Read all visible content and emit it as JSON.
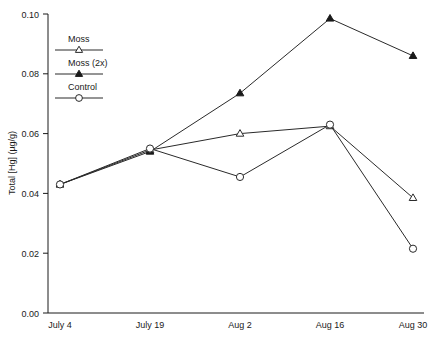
{
  "chart_data": {
    "type": "line",
    "title": "",
    "xlabel": "",
    "ylabel": "Total [Hg] (µg/g)",
    "categories": [
      "July 4",
      "July 19",
      "Aug 2",
      "Aug 16",
      "Aug 30"
    ],
    "ylim": [
      0.0,
      0.1
    ],
    "yticks": [
      0.0,
      0.02,
      0.04,
      0.06,
      0.08,
      0.1
    ],
    "ytick_labels": [
      "0.00",
      "0.02",
      "0.04",
      "0.06",
      "0.08",
      "0.10"
    ],
    "grid": false,
    "legend_position": "top-left",
    "series": [
      {
        "name": "Moss",
        "marker": "open-triangle",
        "values": [
          0.043,
          0.0545,
          0.06,
          0.0625,
          0.0385
        ]
      },
      {
        "name": "Moss (2x)",
        "marker": "filled-triangle",
        "values": [
          0.043,
          0.054,
          0.0735,
          0.0985,
          0.086
        ]
      },
      {
        "name": "Control",
        "marker": "open-circle",
        "values": [
          0.043,
          0.055,
          0.0455,
          0.063,
          0.0215
        ]
      }
    ]
  },
  "legend": {
    "items": [
      {
        "label": "Moss",
        "marker": "open-triangle"
      },
      {
        "label": "Moss (2x)",
        "marker": "filled-triangle"
      },
      {
        "label": "Control",
        "marker": "open-circle"
      }
    ]
  },
  "axes": {
    "y_title": "Total [Hg] (µg/g)",
    "y_labels": [
      "0.00",
      "0.02",
      "0.04",
      "0.06",
      "0.08",
      "0.10"
    ],
    "x_labels": [
      "July 4",
      "July 19",
      "Aug 2",
      "Aug 16",
      "Aug 30"
    ]
  }
}
